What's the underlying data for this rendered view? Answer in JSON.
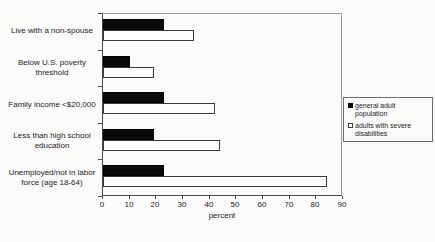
{
  "chart_data": {
    "type": "bar",
    "orientation": "horizontal",
    "categories": [
      "Live with a non-spouse",
      "Below U.S. poverty threshold",
      "Family income <$20,000",
      "Less than high school education",
      "Unemployed/not in labor force (age 18-64)"
    ],
    "series": [
      {
        "name": "general adult population",
        "color": "#0b0b0b",
        "style": "filled-black",
        "values": [
          23,
          10,
          23,
          19,
          23
        ]
      },
      {
        "name": "adults with severe disabilities",
        "color": "#fefefe",
        "style": "white-outlined",
        "values": [
          34,
          19,
          42,
          44,
          84
        ]
      }
    ],
    "xlabel": "percent",
    "xlim": [
      0,
      90
    ],
    "xticks": [
      0,
      10,
      20,
      30,
      40,
      50,
      60,
      70,
      80,
      90
    ],
    "grid": false,
    "legend_position": "right"
  },
  "legend": {
    "items": [
      {
        "label": "general adult population",
        "swatch": "black-filled-square"
      },
      {
        "label": "adults with severe disabilities",
        "swatch": "white-outlined-square"
      }
    ]
  }
}
